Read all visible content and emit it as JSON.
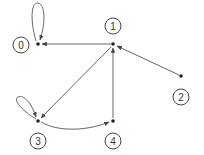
{
  "diagram": {
    "type": "directed-graph",
    "nodes": [
      {
        "id": "0",
        "label": "0",
        "x": 38,
        "y": 44,
        "label_x": 21,
        "label_y": 45
      },
      {
        "id": "1",
        "label": "1",
        "x": 113,
        "y": 44,
        "label_x": 113,
        "label_y": 26
      },
      {
        "id": "2",
        "label": "2",
        "x": 181,
        "y": 76,
        "label_x": 181,
        "label_y": 97
      },
      {
        "id": "3",
        "label": "3",
        "x": 38,
        "y": 121,
        "label_x": 38,
        "label_y": 141
      },
      {
        "id": "4",
        "label": "4",
        "x": 113,
        "y": 121,
        "label_x": 113,
        "label_y": 141
      }
    ],
    "edges": [
      {
        "from": "0",
        "to": "0",
        "kind": "self-loop"
      },
      {
        "from": "1",
        "to": "0",
        "kind": "straight"
      },
      {
        "from": "2",
        "to": "1",
        "kind": "straight"
      },
      {
        "from": "1",
        "to": "3",
        "kind": "straight"
      },
      {
        "from": "3",
        "to": "3",
        "kind": "self-loop"
      },
      {
        "from": "3",
        "to": "4",
        "kind": "curved"
      },
      {
        "from": "4",
        "to": "1",
        "kind": "straight"
      }
    ],
    "colors": {
      "edge": "#555555",
      "dot": "#222222",
      "label_border": "#444444"
    }
  }
}
